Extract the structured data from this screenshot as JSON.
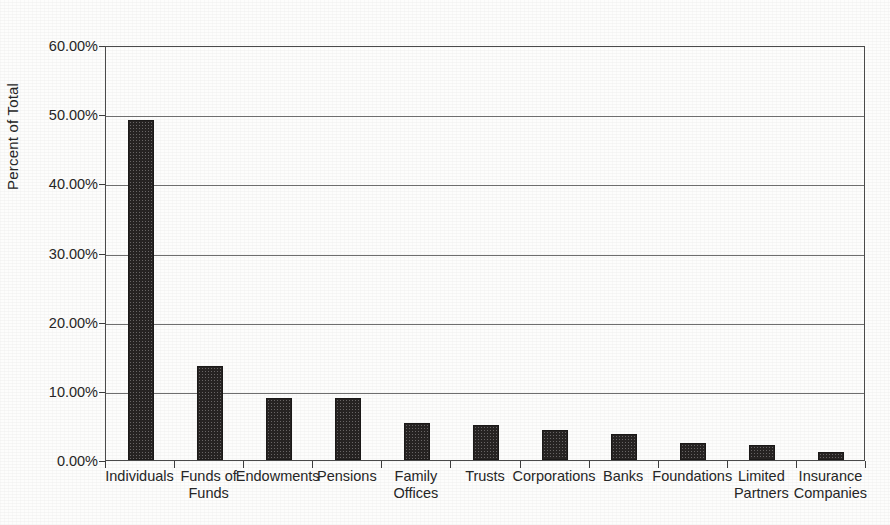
{
  "chart_data": {
    "type": "bar",
    "title": "",
    "subtitle": "",
    "xlabel": "",
    "ylabel": "Percent of Total",
    "ylim": [
      0,
      60
    ],
    "ytick_values": [
      0,
      10,
      20,
      30,
      40,
      50,
      60
    ],
    "ytick_labels": [
      "0.00%",
      "10.00%",
      "20.00%",
      "30.00%",
      "40.00%",
      "50.00%",
      "60.00%"
    ],
    "grid": true,
    "legend": null,
    "bar_color": "#262322",
    "categories": [
      "Individuals",
      "Funds of\nFunds",
      "Endowments",
      "Pensions",
      "Family\nOffices",
      "Trusts",
      "Corporations",
      "Banks",
      "Foundations",
      "Limited\nPartners",
      "Insurance\nCompanies"
    ],
    "values": [
      49.2,
      13.6,
      9.0,
      9.0,
      5.4,
      5.0,
      4.3,
      3.8,
      2.5,
      2.2,
      1.1
    ]
  }
}
